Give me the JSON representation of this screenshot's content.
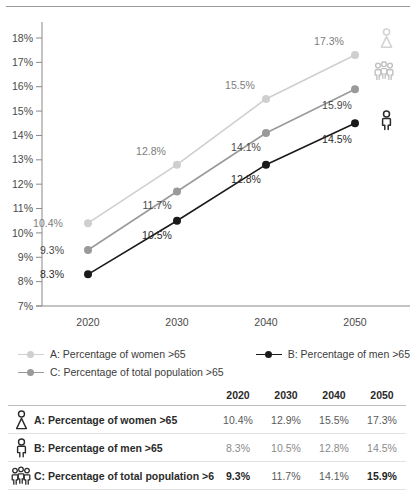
{
  "chart_data": {
    "type": "line",
    "title": "",
    "xlabel": "",
    "ylabel": "",
    "x": [
      "2020",
      "2030",
      "2040",
      "2050"
    ],
    "categories": [
      "2020",
      "2030",
      "2040",
      "2050"
    ],
    "ylim": [
      7,
      18
    ],
    "ytick_labels": [
      "18%",
      "17%",
      "16%",
      "15%",
      "14%",
      "13%",
      "12%",
      "11%",
      "10%",
      "9%",
      "8%",
      "7%"
    ],
    "ytick_values": [
      18,
      17,
      16,
      15,
      14,
      13,
      12,
      11,
      10,
      9,
      8,
      7
    ],
    "grid": false,
    "legend_position": "below",
    "series": [
      {
        "key": "A",
        "name": "A: Percentage of women >65",
        "color": "#cfcfcf",
        "label_color": "#7d7d7d",
        "icon": "woman-icon",
        "values": [
          10.4,
          12.8,
          15.5,
          17.3
        ],
        "point_labels": [
          "10.4%",
          "12.8%",
          "15.5%",
          "17.3%"
        ]
      },
      {
        "key": "C",
        "name": "C: Percentage of total population >65",
        "color": "#9a9a9a",
        "label_color": "#4a4a4a",
        "icon": "group-icon",
        "values": [
          9.3,
          11.7,
          14.1,
          15.9
        ],
        "point_labels": [
          "9.3%",
          "11.7%",
          "14.1%",
          "15.9%"
        ]
      },
      {
        "key": "B",
        "name": "B: Percentage of men >65",
        "color": "#1a1a1a",
        "label_color": "#2b2b2b",
        "icon": "man-icon",
        "values": [
          8.3,
          10.5,
          12.8,
          14.5
        ],
        "point_labels": [
          "8.3%",
          "10.5%",
          "12.8%",
          "14.5%"
        ]
      }
    ]
  },
  "legend": {
    "items": [
      {
        "label": "A: Percentage of women >65",
        "color": "#cfcfcf"
      },
      {
        "label": "B: Percentage of men >65",
        "color": "#1a1a1a"
      },
      {
        "label": "C: Percentage of total population >65",
        "color": "#9a9a9a"
      }
    ]
  },
  "table": {
    "header": {
      "label": "",
      "years": [
        "2020",
        "2030",
        "2040",
        "2050"
      ]
    },
    "rows": [
      {
        "icon": "woman-icon",
        "label": "A: Percentage of women >65",
        "values": [
          "10.4%",
          "12.9%",
          "15.5%",
          "17.3%"
        ],
        "bold": [
          false,
          false,
          false,
          false
        ]
      },
      {
        "icon": "man-icon",
        "label": "B: Percentage of men >65",
        "values": [
          "8.3%",
          "10.5%",
          "12.8%",
          "14.5%"
        ],
        "bold": [
          false,
          false,
          false,
          false
        ]
      },
      {
        "icon": "group-icon",
        "label": "C: Percentage of total population >65",
        "values": [
          "9.3%",
          "11.7%",
          "14.1%",
          "15.9%"
        ],
        "bold": [
          true,
          false,
          false,
          true
        ]
      }
    ]
  }
}
